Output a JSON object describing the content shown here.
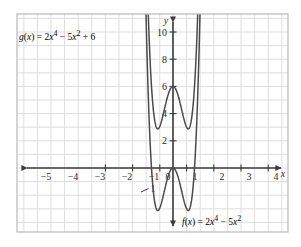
{
  "chart_data": {
    "type": "line",
    "title": "",
    "xlabel": "x",
    "ylabel": "y",
    "xlim": [
      -5.9,
      4.6
    ],
    "ylim": [
      -4.6,
      10.9
    ],
    "grid": true,
    "grid_step": 1,
    "legend": "inline-annotations",
    "x_ticks": [
      "-5",
      "-4",
      "-3",
      "-2",
      "-1",
      "0",
      "1",
      "2",
      "3",
      "4"
    ],
    "x_tick_values": [
      -5,
      -4,
      -3,
      -2,
      -1,
      0,
      1,
      2,
      3,
      4
    ],
    "y_ticks": [
      "10",
      "8",
      "6",
      "4",
      "2",
      "1"
    ],
    "y_tick_values": [
      10,
      8,
      6,
      4,
      2,
      -1
    ],
    "y_negative_tick_label": "1",
    "series": [
      {
        "name": "g",
        "label_text": "g(x) = 2x4 − 5x2 + 6",
        "expression": "2x^4 - 5x^2 + 6",
        "color": "#4a4a4a",
        "coefficients": {
          "a": 2,
          "b": -5,
          "c": 6
        },
        "y_intercept": 6,
        "local_maximum": {
          "x": 0,
          "y": 6
        },
        "local_minima": [
          {
            "x": -1.118,
            "y": 3.125
          },
          {
            "x": 1.118,
            "y": 3.125
          }
        ]
      },
      {
        "name": "f",
        "label_text": "f(x) = 2x4 − 5x2",
        "expression": "2x^4 - 5x^2",
        "color": "#4a4a4a",
        "coefficients": {
          "a": 2,
          "b": -5,
          "c": 0
        },
        "y_intercept": 0,
        "local_maximum": {
          "x": 0,
          "y": 0
        },
        "local_minima": [
          {
            "x": -1.118,
            "y": -3.125
          },
          {
            "x": 1.118,
            "y": -3.125
          }
        ],
        "x_intercepts": [
          -1.581,
          0,
          1.581
        ]
      }
    ]
  },
  "annotations": {
    "g_label": {
      "fn": "g",
      "open": "(",
      "var": "x",
      "close": ")",
      "equals": "=",
      "term1_coef": "2",
      "term1_var": "x",
      "term1_exp": "4",
      "minus": "−",
      "term2_coef": "5",
      "term2_var": "x",
      "term2_exp": "2",
      "plus": "+",
      "constant": "6"
    },
    "f_label": {
      "fn": "f",
      "open": "(",
      "var": "x",
      "close": ")",
      "equals": "=",
      "term1_coef": "2",
      "term1_var": "x",
      "term1_exp": "4",
      "minus": "−",
      "term2_coef": "5",
      "term2_var": "x",
      "term2_exp": "2"
    }
  },
  "axes": {
    "x_axis_name": "x",
    "y_axis_name": "y",
    "x_tick_labels": [
      "−5",
      "−4",
      "−3",
      "−2",
      "−1",
      "0",
      "1",
      "2",
      "3",
      "4"
    ],
    "y_tick_labels": [
      "10",
      "8",
      "6",
      "4",
      "2"
    ],
    "below_axis_label": "1"
  },
  "style": {
    "curve_color": "#4a4a4a",
    "axis_color": "#3a3a3a",
    "grid_color": "#dedede",
    "frame_color": "#b8b8b8",
    "background": "#ffffff",
    "text_color": "#2b2b2b"
  }
}
